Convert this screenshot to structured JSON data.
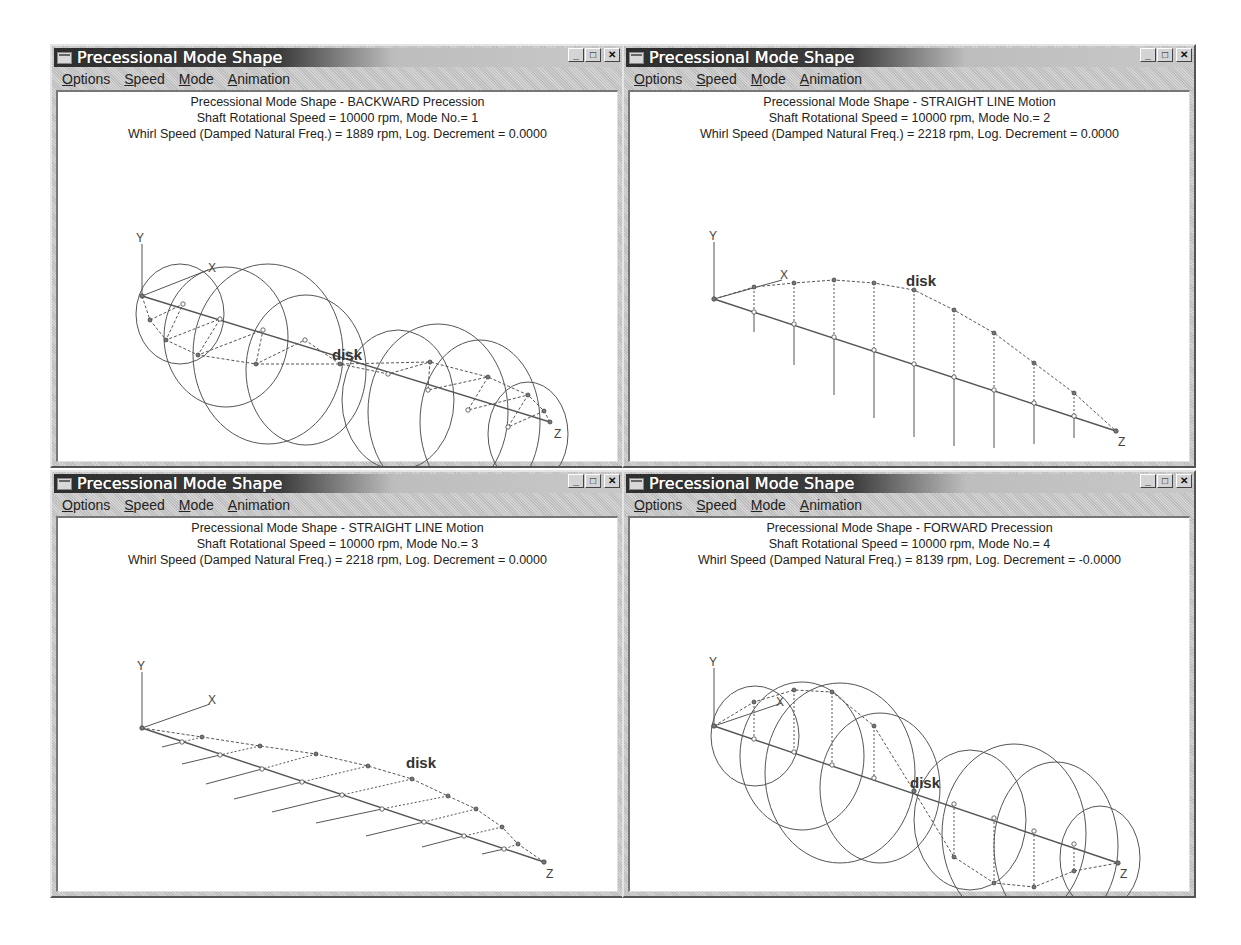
{
  "windows": [
    {
      "title": "Precessional Mode Shape",
      "menu": [
        "Options",
        "Speed",
        "Mode",
        "Animation"
      ],
      "header": [
        "Precessional Mode Shape - BACKWARD Precession",
        "Shaft Rotational Speed = 10000 rpm, Mode No.= 1",
        "Whirl Speed (Damped Natural Freq.) = 1889 rpm, Log. Decrement = 0.0000"
      ],
      "axes": {
        "y": "Y",
        "x": "X",
        "z": "Z"
      },
      "disk_label": "disk",
      "motion": "BACKWARD Precession",
      "mode_no": 1,
      "whirl_speed_rpm": 1889,
      "log_decrement": "0.0000"
    },
    {
      "title": "Precessional Mode Shape",
      "menu": [
        "Options",
        "Speed",
        "Mode",
        "Animation"
      ],
      "header": [
        "Precessional Mode Shape - STRAIGHT LINE Motion",
        "Shaft Rotational Speed = 10000 rpm, Mode No.= 2",
        "Whirl Speed (Damped Natural Freq.) = 2218 rpm, Log. Decrement = 0.0000"
      ],
      "axes": {
        "y": "Y",
        "x": "X",
        "z": "Z"
      },
      "disk_label": "disk",
      "motion": "STRAIGHT LINE Motion",
      "mode_no": 2,
      "whirl_speed_rpm": 2218,
      "log_decrement": "0.0000"
    },
    {
      "title": "Precessional Mode Shape",
      "menu": [
        "Options",
        "Speed",
        "Mode",
        "Animation"
      ],
      "header": [
        "Precessional Mode Shape - STRAIGHT LINE Motion",
        "Shaft Rotational Speed = 10000 rpm, Mode No.= 3",
        "Whirl Speed (Damped Natural Freq.) = 2218 rpm, Log. Decrement = 0.0000"
      ],
      "axes": {
        "y": "Y",
        "x": "X",
        "z": "Z"
      },
      "disk_label": "disk",
      "motion": "STRAIGHT LINE Motion",
      "mode_no": 3,
      "whirl_speed_rpm": 2218,
      "log_decrement": "0.0000"
    },
    {
      "title": "Precessional Mode Shape",
      "menu": [
        "Options",
        "Speed",
        "Mode",
        "Animation"
      ],
      "header": [
        "Precessional Mode Shape - FORWARD Precession",
        "Shaft Rotational Speed = 10000 rpm, Mode No.= 4",
        "Whirl Speed (Damped Natural Freq.) = 8139 rpm, Log. Decrement = -0.0000"
      ],
      "axes": {
        "y": "Y",
        "x": "X",
        "z": "Z"
      },
      "disk_label": "disk",
      "motion": "FORWARD Precession",
      "mode_no": 4,
      "whirl_speed_rpm": 8139,
      "log_decrement": "-0.0000"
    }
  ],
  "shaft_rotational_speed_rpm": 10000,
  "icons": {
    "minimize": "_",
    "maximize": "□",
    "close": "✕"
  }
}
